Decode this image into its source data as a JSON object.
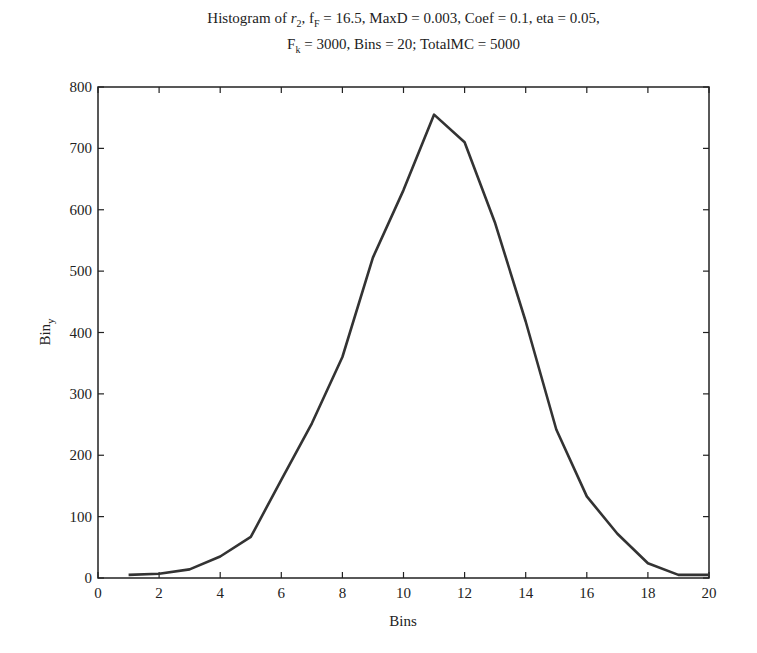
{
  "chart_data": {
    "type": "line",
    "title_line1_prefix": "Histogram of ",
    "title_var": "r",
    "title_var_sub": "2",
    "title_line1_mid": ", f",
    "title_f_sub": "F",
    "title_line1_rest": " = 16.5, MaxD = 0.003, Coef = 0.1, eta = 0.05,",
    "title_line2_prefix": "F",
    "title_line2_sub": "k",
    "title_line2_rest": " = 3000, Bins = 20; TotalMC = 5000",
    "title": "Histogram of r2, fF = 16.5, MaxD = 0.003, Coef = 0.1, eta = 0.05, Fk = 3000, Bins = 20; TotalMC = 5000",
    "xlabel": "Bins",
    "ylabel": "Bin",
    "ylabel_sub": "y",
    "xlim": [
      0,
      20
    ],
    "ylim": [
      0,
      800
    ],
    "xticks": [
      0,
      2,
      4,
      6,
      8,
      10,
      12,
      14,
      16,
      18,
      20
    ],
    "yticks": [
      0,
      100,
      200,
      300,
      400,
      500,
      600,
      700,
      800
    ],
    "grid": false,
    "x": [
      1,
      2,
      3,
      4,
      5,
      6,
      7,
      8,
      9,
      10,
      11,
      12,
      13,
      14,
      15,
      16,
      17,
      18,
      19,
      20
    ],
    "series": [
      {
        "name": "Bin_y",
        "color": "#333333",
        "values": [
          5,
          7,
          14,
          35,
          67,
          160,
          252,
          360,
          522,
          632,
          755,
          710,
          578,
          418,
          242,
          133,
          72,
          24,
          5,
          5
        ]
      }
    ]
  }
}
